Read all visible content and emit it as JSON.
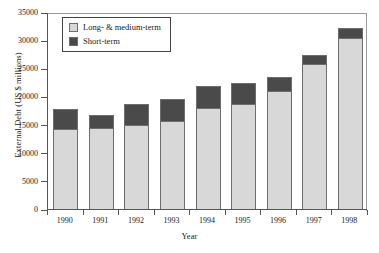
{
  "chart_data": {
    "type": "bar",
    "title": "",
    "subtitle": "",
    "xlabel": "Year",
    "ylabel": "External Debt (US $ millions)",
    "stacked": true,
    "orientation": "vertical",
    "grid": false,
    "legend_position": "top-left",
    "categories": [
      "1990",
      "1991",
      "1992",
      "1993",
      "1994",
      "1995",
      "1996",
      "1997",
      "1998"
    ],
    "ylim": [
      0,
      35000
    ],
    "yticks": [
      0,
      5000,
      10000,
      15000,
      20000,
      25000,
      30000,
      35000
    ],
    "ytick_labels": [
      "0",
      "5000",
      "10000",
      "15000",
      "20000",
      "25000",
      "30000",
      "35000"
    ],
    "series": [
      {
        "name": "Long- & medium-term",
        "color": "#d8d8d8",
        "values": [
          14200,
          14400,
          15000,
          15700,
          17900,
          18700,
          20900,
          25700,
          30400
        ]
      },
      {
        "name": "Short-term",
        "color": "#4a4a4a",
        "values": [
          3600,
          2300,
          3700,
          3900,
          4000,
          3700,
          2600,
          1600,
          1700
        ]
      }
    ],
    "totals": [
      17800,
      16700,
      18700,
      19600,
      21900,
      22400,
      23500,
      27300,
      32100
    ]
  },
  "legend": {
    "entries": [
      {
        "label": "Long- & medium-term",
        "swatch": "long-term-swatch"
      },
      {
        "label": "Short-term",
        "swatch": "short-term-swatch"
      }
    ]
  },
  "colors": {
    "long_term": "#d8d8d8",
    "short_term": "#4a4a4a",
    "axis": "#555555",
    "frame": "#9a9a9a",
    "background": "#ffffff"
  }
}
